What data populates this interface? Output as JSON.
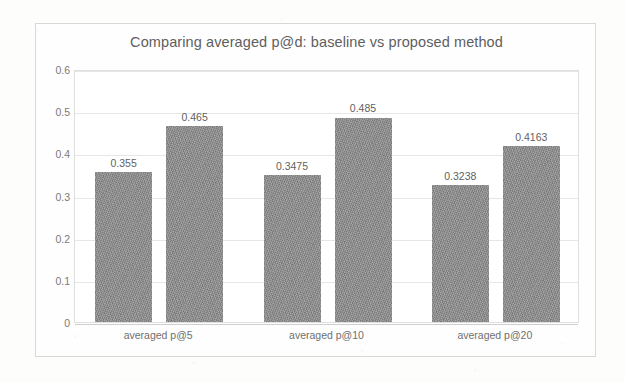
{
  "chart_data": {
    "type": "bar",
    "title": "Comparing averaged p@d: baseline vs proposed method",
    "xlabel": "",
    "ylabel": "",
    "categories": [
      "averaged p@5",
      "averaged p@10",
      "averaged p@20"
    ],
    "series": [
      {
        "name": "Baseline",
        "color": "#8b8b8b",
        "values": [
          0.355,
          0.3475,
          0.3238
        ],
        "labels": [
          "0.355",
          "0.3475",
          "0.3238"
        ]
      },
      {
        "name": "Proposed",
        "color": "#8b8b8b",
        "values": [
          0.465,
          0.485,
          0.4163
        ],
        "labels": [
          "0.465",
          "0.485",
          "0.4163"
        ]
      }
    ],
    "ylim": [
      0,
      0.6
    ],
    "y_ticks": [
      0,
      0.1,
      0.2,
      0.3,
      0.4,
      0.5,
      0.6
    ],
    "y_tick_labels": [
      "0",
      "0.1",
      "0.2",
      "0.3",
      "0.4",
      "0.5",
      "0.6"
    ],
    "grid": true,
    "legend_position": "top-right"
  },
  "legend": {
    "entries": [
      {
        "label": "Baseline"
      },
      {
        "label": "Proposed"
      }
    ]
  },
  "axis": {
    "y_tick_labels": [
      "0.6",
      "0.5",
      "0.4",
      "0.3",
      "0.2",
      "0.1",
      "0"
    ],
    "x_tick_labels": [
      "averaged p@5",
      "averaged p@10",
      "averaged p@20"
    ]
  },
  "bar_labels": {
    "group1": {
      "baseline": "0.355",
      "proposed": "0.465"
    },
    "group2": {
      "baseline": "0.3475",
      "proposed": "0.485"
    },
    "group3": {
      "baseline": "0.3238",
      "proposed": "0.4163"
    }
  }
}
